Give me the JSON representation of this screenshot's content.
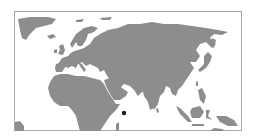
{
  "map": {
    "region": "Eastern Hemisphere (Europe, Africa, Asia)",
    "colors": {
      "land": "#8d8d8d",
      "water": "#ffffff",
      "frame": "#a8a8a8",
      "marker": "#1a1a1a"
    },
    "marker": {
      "label": "location-marker",
      "x": 124,
      "y": 113,
      "approx_location": "Arabian Sea, east of Horn of Africa"
    }
  }
}
